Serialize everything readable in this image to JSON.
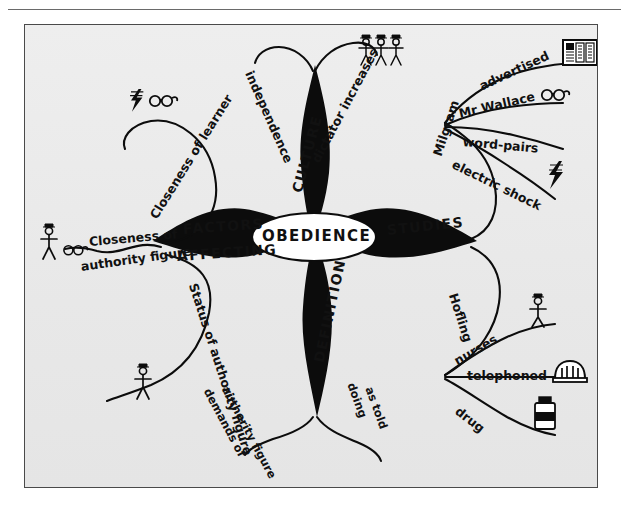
{
  "document": {
    "type": "hand-drawn mind map",
    "central_topic": "OBEDIENCE"
  },
  "center": {
    "label": "OBEDIENCE"
  },
  "branches": [
    {
      "id": "factors-affecting",
      "label_line1": "FACTORS",
      "label_line2": "AFFECTING",
      "direction": "left",
      "children": [
        {
          "id": "closeness-of-learner",
          "label": "Closeness of learner",
          "icons": [
            "lightning-bolt-icon",
            "glasses-icon"
          ]
        },
        {
          "id": "closeness-of-authority-figure",
          "label_line1": "Closeness of",
          "label_line2": "authority figure",
          "icons": [
            "stick-figure-icon",
            "glasses-icon"
          ]
        },
        {
          "id": "status-of-authority-figure",
          "label": "Status of authority figure",
          "icons": [
            "stick-figure-icon"
          ]
        }
      ]
    },
    {
      "id": "culture",
      "label": "CULTURE",
      "direction": "up",
      "children": [
        {
          "id": "independence",
          "label": "independence",
          "icons": []
        },
        {
          "id": "dictator-increases",
          "label": "dictator increases",
          "icons": [
            "three-people-icon"
          ]
        }
      ]
    },
    {
      "id": "studies",
      "label": "STUDIES",
      "direction": "right",
      "children": [
        {
          "id": "milgram",
          "label": "Milgram",
          "children": [
            {
              "id": "advertised",
              "label": "advertised",
              "icons": [
                "newspaper-icon"
              ]
            },
            {
              "id": "mr-wallace",
              "label": "Mr Wallace",
              "icons": [
                "glasses-icon"
              ]
            },
            {
              "id": "word-pairs",
              "label": "word-pairs",
              "icons": []
            },
            {
              "id": "electric-shock",
              "label": "electric shock",
              "icons": [
                "lightning-bolt-icon"
              ]
            }
          ]
        },
        {
          "id": "hofling",
          "label": "Hofling",
          "children": [
            {
              "id": "nurses",
              "label": "nurses",
              "icons": [
                "stick-figure-icon"
              ]
            },
            {
              "id": "telephoned",
              "label": "telephoned",
              "icons": [
                "telephone-icon"
              ]
            },
            {
              "id": "drug",
              "label": "drug",
              "icons": [
                "pill-bottle-icon"
              ]
            }
          ]
        }
      ]
    },
    {
      "id": "definition",
      "label": "DEFINITION",
      "direction": "down",
      "children": [
        {
          "id": "demands-of-authority-figure",
          "label_line1": "demands of",
          "label_line2": "authority figure",
          "icons": []
        },
        {
          "id": "doing-as-told",
          "label_line1": "doing",
          "label_line2": "as told",
          "icons": []
        }
      ]
    }
  ],
  "colors": {
    "ink": "#111111",
    "paper": "#ececec",
    "frame": "#4a4a4a"
  }
}
